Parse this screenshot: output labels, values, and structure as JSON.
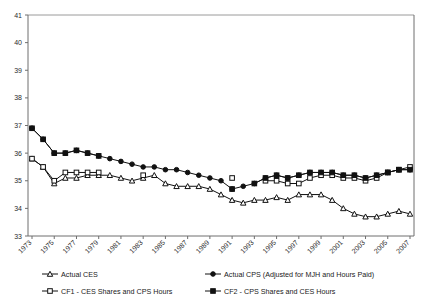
{
  "chart_data": {
    "type": "line",
    "title": "",
    "xlabel": "",
    "ylabel": "",
    "ylim": [
      33,
      41
    ],
    "xlim": [
      1973,
      2007
    ],
    "grid": false,
    "legend_position": "bottom",
    "ytick_labels": [
      "41",
      "40",
      "39",
      "38",
      "37",
      "36",
      "35",
      "34",
      "33"
    ],
    "yticks": [
      41,
      40,
      39,
      38,
      37,
      36,
      35,
      34,
      33
    ],
    "xtick_labels": [
      "1973",
      "1975",
      "1977",
      "1979",
      "1981",
      "1983",
      "1985",
      "1987",
      "1989",
      "1991",
      "1993",
      "1995",
      "1997",
      "1999",
      "2001",
      "2003",
      "2005",
      "2007"
    ],
    "xticks": [
      1973,
      1975,
      1977,
      1979,
      1981,
      1983,
      1985,
      1987,
      1989,
      1991,
      1993,
      1995,
      1997,
      1999,
      2001,
      2003,
      2005,
      2007
    ],
    "x": [
      1973,
      1974,
      1975,
      1976,
      1977,
      1978,
      1979,
      1980,
      1981,
      1982,
      1983,
      1984,
      1985,
      1986,
      1987,
      1988,
      1989,
      1990,
      1991,
      1992,
      1993,
      1994,
      1995,
      1996,
      1997,
      1998,
      1999,
      2000,
      2001,
      2002,
      2003,
      2004,
      2005,
      2006,
      2007
    ],
    "series": [
      {
        "name": "Actual CES",
        "marker": "open-triangle",
        "color": "#111111",
        "values": [
          35.8,
          35.5,
          34.9,
          35.1,
          35.1,
          35.2,
          35.2,
          35.2,
          35.1,
          35.0,
          35.1,
          35.2,
          34.9,
          34.8,
          34.8,
          34.8,
          34.7,
          34.5,
          34.3,
          34.2,
          34.3,
          34.3,
          34.4,
          34.3,
          34.5,
          34.5,
          34.5,
          34.3,
          34.0,
          33.8,
          33.7,
          33.7,
          33.8,
          33.9,
          33.8
        ]
      },
      {
        "name": "Actual CPS (Adjusted for MJH and Hours Paid)",
        "marker": "filled-circle",
        "color": "#111111",
        "values": [
          36.9,
          36.5,
          36.0,
          36.0,
          36.1,
          36.0,
          35.9,
          35.8,
          35.7,
          35.6,
          35.5,
          35.5,
          35.4,
          35.4,
          35.3,
          35.2,
          35.1,
          35.0,
          34.7,
          34.8,
          34.9,
          35.1,
          35.2,
          35.1,
          35.2,
          35.3,
          35.3,
          35.3,
          35.2,
          35.2,
          35.1,
          35.2,
          35.3,
          35.4,
          35.4
        ]
      },
      {
        "name": "CF1 - CES Shares and CPS Hours",
        "marker": "open-square",
        "color": "#111111",
        "segments": [
          {
            "x": [
              1973,
              1974,
              1975,
              1976,
              1977,
              1978,
              1979
            ],
            "values": [
              35.8,
              35.5,
              35.0,
              35.3,
              35.3,
              35.3,
              35.3
            ]
          },
          {
            "x": [
              1983
            ],
            "values": [
              35.2
            ]
          },
          {
            "x": [
              1991
            ],
            "values": [
              35.1
            ]
          },
          {
            "x": [
              1994,
              1995,
              1996,
              1997,
              1998,
              1999,
              2000,
              2001,
              2002,
              2003,
              2004,
              2005,
              2006,
              2007
            ],
            "values": [
              35.0,
              35.0,
              34.9,
              34.9,
              35.1,
              35.2,
              35.2,
              35.1,
              35.1,
              35.0,
              35.1,
              35.3,
              35.4,
              35.5
            ]
          }
        ]
      },
      {
        "name": "CF2 - CPS Shares and CES Hours",
        "marker": "filled-square",
        "color": "#111111",
        "segments": [
          {
            "x": [
              1973,
              1974,
              1975,
              1976,
              1977,
              1978,
              1979
            ],
            "values": [
              36.9,
              36.5,
              36.0,
              36.0,
              36.1,
              36.0,
              35.9
            ]
          },
          {
            "x": [
              1991
            ],
            "values": [
              34.7
            ]
          },
          {
            "x": [
              1993,
              1994,
              1995,
              1996,
              1997,
              1998,
              1999,
              2000,
              2001,
              2002,
              2003,
              2004,
              2005,
              2006,
              2007
            ],
            "values": [
              34.9,
              35.1,
              35.2,
              35.1,
              35.2,
              35.3,
              35.3,
              35.3,
              35.2,
              35.2,
              35.1,
              35.2,
              35.3,
              35.4,
              35.4
            ]
          }
        ]
      }
    ],
    "legend": [
      {
        "label": "Actual CES",
        "marker": "open-triangle"
      },
      {
        "label": "Actual CPS (Adjusted for MJH and Hours Paid)",
        "marker": "filled-circle"
      },
      {
        "label": "CF1 - CES Shares and CPS Hours",
        "marker": "open-square"
      },
      {
        "label": "CF2 - CPS Shares and CES Hours",
        "marker": "filled-square"
      }
    ]
  }
}
